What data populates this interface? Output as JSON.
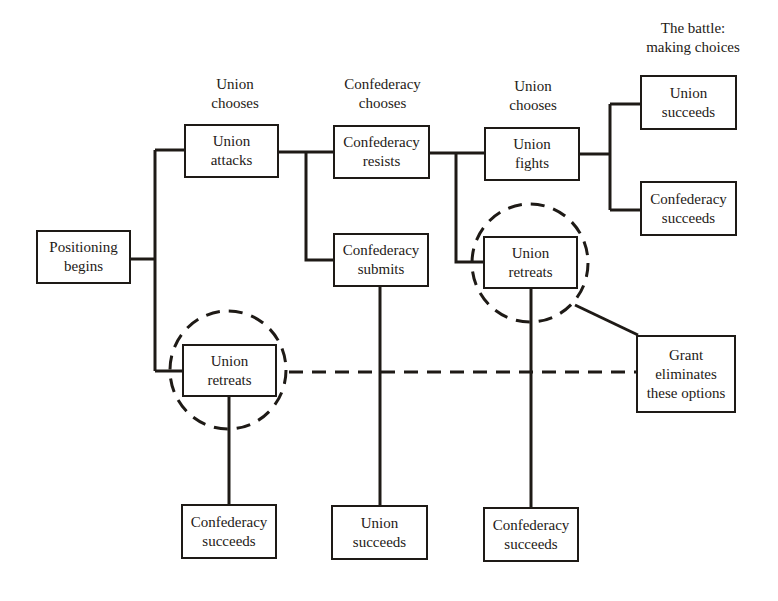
{
  "headers": {
    "col1": [
      "Union",
      "chooses"
    ],
    "col2": [
      "Confederacy",
      "chooses"
    ],
    "col3": [
      "Union",
      "chooses"
    ],
    "col4": [
      "The battle:",
      "making choices"
    ]
  },
  "nodes": {
    "positioning_begins": [
      "Positioning",
      "begins"
    ],
    "union_attacks": [
      "Union",
      "attacks"
    ],
    "union_retreats_1": [
      "Union",
      "retreats"
    ],
    "confederacy_resists": [
      "Confederacy",
      "resists"
    ],
    "confederacy_submits": [
      "Confederacy",
      "submits"
    ],
    "union_fights": [
      "Union",
      "fights"
    ],
    "union_retreats_2": [
      "Union",
      "retreats"
    ],
    "union_succeeds_top": [
      "Union",
      "succeeds"
    ],
    "confederacy_succeeds_top": [
      "Confederacy",
      "succeeds"
    ],
    "grant_eliminates": [
      "Grant",
      "eliminates",
      "these options"
    ],
    "confederacy_succeeds_bottom_1": [
      "Confederacy",
      "succeeds"
    ],
    "union_succeeds_bottom": [
      "Union",
      "succeeds"
    ],
    "confederacy_succeeds_bottom_2": [
      "Confederacy",
      "succeeds"
    ]
  },
  "colors": {
    "ink": "#1e1a16",
    "background": "#ffffff"
  }
}
